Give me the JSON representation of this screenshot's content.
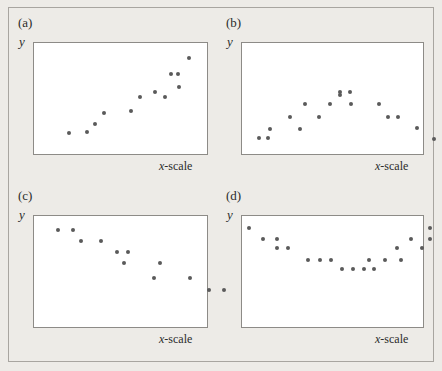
{
  "figure": {
    "width": 442,
    "height": 371,
    "background_color": "#edebe7",
    "frame_color": "#a8a5a0",
    "point_color": "#5a5a5a",
    "plot_border_color": "#8d8b87",
    "plot_fill_color": "#ffffff"
  },
  "chart_data": [
    {
      "type": "scatter",
      "panel": "a",
      "label": "(a)",
      "title": "",
      "xlabel": "x-scale",
      "ylabel": "y",
      "xlim": [
        0,
        100
      ],
      "ylim": [
        0,
        100
      ],
      "grid": false,
      "legend": "none",
      "description": "strong positive linear association",
      "points": [
        {
          "x": 20.0,
          "y": 18.6
        },
        {
          "x": 30.5,
          "y": 19.5
        },
        {
          "x": 35.4,
          "y": 27.4
        },
        {
          "x": 40.2,
          "y": 37.2
        },
        {
          "x": 56.1,
          "y": 38.9
        },
        {
          "x": 61.0,
          "y": 51.3
        },
        {
          "x": 70.1,
          "y": 55.8
        },
        {
          "x": 75.6,
          "y": 51.3
        },
        {
          "x": 79.3,
          "y": 71.7
        },
        {
          "x": 83.5,
          "y": 71.7
        },
        {
          "x": 84.1,
          "y": 60.2
        },
        {
          "x": 89.6,
          "y": 86.7
        }
      ]
    },
    {
      "type": "scatter",
      "panel": "b",
      "label": "(b)",
      "title": "",
      "xlabel": "x-scale",
      "ylabel": "y",
      "xlim": [
        0,
        100
      ],
      "ylim": [
        0,
        100
      ],
      "grid": false,
      "legend": "none",
      "description": "curved inverted-U association",
      "points": [
        {
          "x": 9.5,
          "y": 14.2
        },
        {
          "x": 14.6,
          "y": 14.2
        },
        {
          "x": 15.2,
          "y": 22.1
        },
        {
          "x": 26.6,
          "y": 33.6
        },
        {
          "x": 32.3,
          "y": 22.1
        },
        {
          "x": 34.8,
          "y": 45.1
        },
        {
          "x": 42.4,
          "y": 33.6
        },
        {
          "x": 48.7,
          "y": 45.1
        },
        {
          "x": 54.4,
          "y": 53.1
        },
        {
          "x": 54.4,
          "y": 55.8
        },
        {
          "x": 59.5,
          "y": 55.8
        },
        {
          "x": 60.1,
          "y": 45.1
        },
        {
          "x": 75.9,
          "y": 45.1
        },
        {
          "x": 80.4,
          "y": 33.6
        },
        {
          "x": 86.1,
          "y": 33.6
        },
        {
          "x": 96.8,
          "y": 23.0
        },
        {
          "x": 106.3,
          "y": 13.3
        }
      ]
    },
    {
      "type": "scatter",
      "panel": "c",
      "label": "(c)",
      "title": "",
      "xlabel": "x-scale",
      "ylabel": "y",
      "xlim": [
        0,
        100
      ],
      "ylim": [
        0,
        100
      ],
      "grid": false,
      "legend": "none",
      "description": "negative (decreasing) association",
      "points": [
        {
          "x": 14.0,
          "y": 87.6
        },
        {
          "x": 22.8,
          "y": 87.6
        },
        {
          "x": 27.2,
          "y": 77.9
        },
        {
          "x": 38.6,
          "y": 77.9
        },
        {
          "x": 48.2,
          "y": 67.3
        },
        {
          "x": 54.4,
          "y": 67.3
        },
        {
          "x": 51.8,
          "y": 57.5
        },
        {
          "x": 72.8,
          "y": 57.5
        },
        {
          "x": 69.3,
          "y": 44.2
        },
        {
          "x": 90.4,
          "y": 44.2
        },
        {
          "x": 100.9,
          "y": 33.6
        },
        {
          "x": 109.6,
          "y": 33.6
        }
      ]
    },
    {
      "type": "scatter",
      "panel": "d",
      "label": "(d)",
      "title": "",
      "xlabel": "x-scale",
      "ylabel": "y",
      "xlim": [
        0,
        100
      ],
      "ylim": [
        0,
        100
      ],
      "grid": false,
      "legend": "none",
      "description": "curved U-shaped (parabolic) association",
      "points": [
        {
          "x": 4.0,
          "y": 89.4
        },
        {
          "x": 11.4,
          "y": 79.6
        },
        {
          "x": 19.6,
          "y": 79.6
        },
        {
          "x": 19.6,
          "y": 70.8
        },
        {
          "x": 25.5,
          "y": 70.8
        },
        {
          "x": 36.5,
          "y": 60.2
        },
        {
          "x": 42.9,
          "y": 60.2
        },
        {
          "x": 49.4,
          "y": 60.2
        },
        {
          "x": 55.4,
          "y": 52.2
        },
        {
          "x": 61.3,
          "y": 52.2
        },
        {
          "x": 67.3,
          "y": 52.2
        },
        {
          "x": 73.2,
          "y": 52.2
        },
        {
          "x": 70.4,
          "y": 60.2
        },
        {
          "x": 79.2,
          "y": 60.2
        },
        {
          "x": 87.9,
          "y": 60.2
        },
        {
          "x": 85.4,
          "y": 70.8
        },
        {
          "x": 93.6,
          "y": 79.6
        },
        {
          "x": 99.6,
          "y": 70.8
        },
        {
          "x": 104.0,
          "y": 79.6
        },
        {
          "x": 104.0,
          "y": 89.4
        }
      ]
    }
  ]
}
